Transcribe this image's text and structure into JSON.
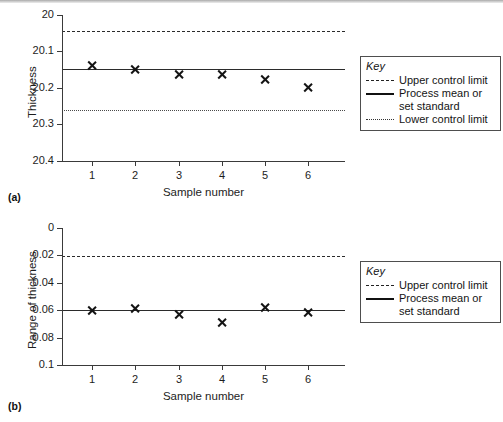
{
  "figure": {
    "panels": [
      {
        "tag": "(a)",
        "ylabel": "Thickness",
        "xlabel": "Sample number",
        "yticks": [
          "20.4",
          "20.3",
          "20.2",
          "20.1",
          "20"
        ],
        "xticks": [
          "1",
          "2",
          "3",
          "4",
          "5",
          "6"
        ],
        "legend": {
          "title": "Key",
          "entries": [
            {
              "style": "dashed",
              "label": "Upper control limit",
              "label2": ""
            },
            {
              "style": "solid",
              "label": "Process mean or",
              "label2": "set standard"
            },
            {
              "style": "dotted",
              "label": "Lower control limit",
              "label2": ""
            }
          ]
        }
      },
      {
        "tag": "(b)",
        "ylabel": "Range of thickness",
        "xlabel": "Sample number",
        "yticks": [
          "0.1",
          "0.08",
          "0.06",
          "0.04",
          "0.02",
          "0"
        ],
        "xticks": [
          "1",
          "2",
          "3",
          "4",
          "5",
          "6"
        ],
        "legend": {
          "title": "Key",
          "entries": [
            {
              "style": "dashed",
              "label": "Upper control limit",
              "label2": ""
            },
            {
              "style": "solid",
              "label": "Process mean or",
              "label2": "set standard"
            }
          ]
        }
      }
    ]
  },
  "chart_data": [
    {
      "type": "scatter",
      "panel": "(a)",
      "title": "",
      "xlabel": "Sample number",
      "ylabel": "Thickness",
      "x": [
        1,
        2,
        3,
        4,
        5,
        6
      ],
      "values": [
        20.263,
        20.252,
        20.238,
        20.238,
        20.224,
        20.202
      ],
      "series": [
        {
          "name": "Sample mean thickness",
          "marker": "x",
          "values": [
            20.263,
            20.252,
            20.238,
            20.238,
            20.224,
            20.202
          ]
        }
      ],
      "reference_lines": [
        {
          "name": "Upper control limit",
          "style": "dashed",
          "value": 20.356
        },
        {
          "name": "Process mean or set standard",
          "style": "solid",
          "value": 20.251
        },
        {
          "name": "Lower control limit",
          "style": "dotted",
          "value": 20.139
        }
      ],
      "xlim": [
        0.3,
        6.85
      ],
      "ylim": [
        20.0,
        20.4
      ],
      "yticks": [
        20.0,
        20.1,
        20.2,
        20.3,
        20.4
      ],
      "xticks": [
        1,
        2,
        3,
        4,
        5,
        6
      ],
      "grid": false,
      "legend_position": "right-outside"
    },
    {
      "type": "scatter",
      "panel": "(b)",
      "title": "",
      "xlabel": "Sample number",
      "ylabel": "Range of thickness",
      "x": [
        1,
        2,
        3,
        4,
        5,
        6
      ],
      "values": [
        0.0395,
        0.0415,
        0.0365,
        0.031,
        0.042,
        0.038
      ],
      "series": [
        {
          "name": "Sample range of thickness",
          "marker": "x",
          "values": [
            0.0395,
            0.0415,
            0.0365,
            0.031,
            0.042,
            0.038
          ]
        }
      ],
      "reference_lines": [
        {
          "name": "Upper control limit",
          "style": "dashed",
          "value": 0.0795
        },
        {
          "name": "Process mean or set standard",
          "style": "solid",
          "value": 0.0398
        }
      ],
      "xlim": [
        0.3,
        6.85
      ],
      "ylim": [
        0,
        0.1
      ],
      "yticks": [
        0,
        0.02,
        0.04,
        0.06,
        0.08,
        0.1
      ],
      "xticks": [
        1,
        2,
        3,
        4,
        5,
        6
      ],
      "grid": false,
      "legend_position": "right-outside"
    }
  ]
}
